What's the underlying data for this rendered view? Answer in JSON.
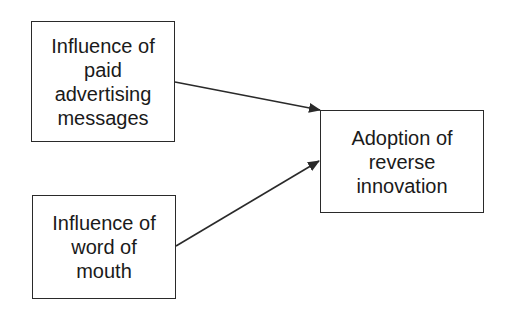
{
  "diagram": {
    "type": "flowchart",
    "nodes": [
      {
        "id": "paid-advertising",
        "lines": [
          "Influence of",
          "paid",
          "advertising",
          "messages"
        ]
      },
      {
        "id": "word-of-mouth",
        "lines": [
          "Influence of",
          "word of",
          "mouth"
        ]
      },
      {
        "id": "adoption",
        "lines": [
          "Adoption of",
          "reverse",
          "innovation"
        ]
      }
    ],
    "edges": [
      {
        "from": "paid-advertising",
        "to": "adoption",
        "arrow": "filled-triangle"
      },
      {
        "from": "word-of-mouth",
        "to": "adoption",
        "arrow": "filled-triangle"
      }
    ],
    "colors": {
      "stroke": "#2a2a2a",
      "text": "#1a1a1a",
      "background": "#ffffff"
    }
  }
}
